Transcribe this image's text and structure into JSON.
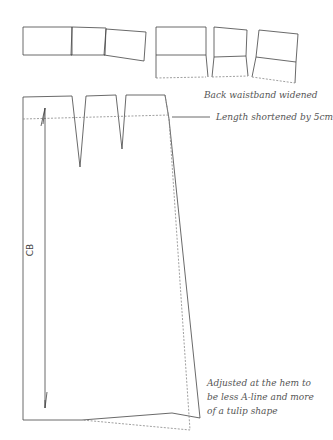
{
  "annotations": {
    "waistband": "Back waistband widened",
    "length": "Length shortened by 5cm",
    "hem_line1": "Adjusted at the hem to",
    "hem_line2": "be less A-line and more",
    "hem_line3": "of a tulip shape",
    "cb": "CB"
  },
  "colors": {
    "line": "#444444",
    "dashed": "#888888",
    "text": "#555555"
  }
}
